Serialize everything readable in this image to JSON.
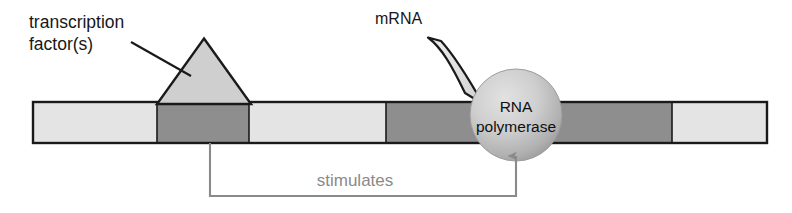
{
  "diagram": {
    "background_color": "#ffffff",
    "width": 792,
    "height": 213
  },
  "labels": {
    "transcription_factor_line1": "transcription",
    "transcription_factor_line2": "factor(s)",
    "mrna": "mRNA",
    "rna_polymerase_line1": "RNA",
    "rna_polymerase_line2": "polymerase",
    "stimulates": "stimulates"
  },
  "colors": {
    "outline": "#1a1a1a",
    "segment_light": "#e4e4e4",
    "segment_dark": "#8e8e8e",
    "triangle_fill": "#cfcfcf",
    "polymerase_light": "#d6d6d6",
    "polymerase_dark": "#9a9a9a",
    "mrna_fill": "#e0e0e0",
    "connector": "#8a8a8a",
    "text_dark": "#17171a",
    "text_gray": "#8a8a8a"
  },
  "dna_bar": {
    "x": 33,
    "y": 102,
    "width": 734,
    "height": 41,
    "segments": [
      {
        "name": "segment-1",
        "shade": "light",
        "x": 33,
        "width": 124
      },
      {
        "name": "segment-2",
        "shade": "dark",
        "x": 157,
        "width": 92
      },
      {
        "name": "segment-3",
        "shade": "light",
        "x": 249,
        "width": 137
      },
      {
        "name": "segment-4",
        "shade": "dark",
        "x": 386,
        "width": 286
      },
      {
        "name": "segment-5",
        "shade": "light",
        "x": 672,
        "width": 95
      }
    ]
  },
  "transcription_factor": {
    "apex_x": 204,
    "apex_y": 39,
    "base_left_x": 158,
    "base_right_x": 250,
    "base_y": 103
  },
  "rna_polymerase": {
    "center_x": 516,
    "center_y": 115,
    "radius": 46
  },
  "mrna_ribbon": {
    "tip_x": 430,
    "tip_y": 38
  },
  "connector": {
    "start_x": 210,
    "start_y": 143,
    "bottom_y": 196,
    "arrow_x": 516,
    "arrow_tip_y": 148,
    "label_x": 355,
    "label_y": 186
  }
}
